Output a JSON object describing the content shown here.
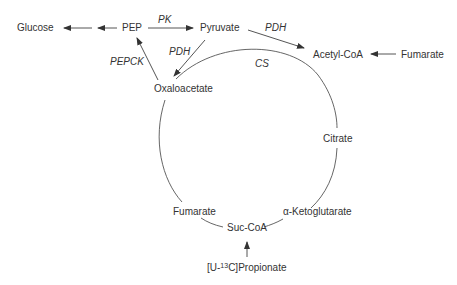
{
  "diagram": {
    "type": "metabolic-pathway",
    "nodes": {
      "glucose": "Glucose",
      "pep": "PEP",
      "pyruvate": "Pyruvate",
      "acetyl_coa": "Acetyl-CoA",
      "fumarate_in": "Fumarate",
      "oxaloacetate": "Oxaloacetate",
      "citrate": "Citrate",
      "alpha_kg": "α-Ketoglutarate",
      "suc_coa": "Suc-CoA",
      "fumarate": "Fumarate",
      "propionate_prefix": "[U-",
      "propionate_sup": "13",
      "propionate_suffix": "C]Propionate"
    },
    "enzymes": {
      "pk": "PK",
      "pdh_top": "PDH",
      "pdh_left": "PDH",
      "pepck": "PEPCK",
      "cs": "CS"
    },
    "edges": [
      {
        "from": "PEP",
        "to": "Glucose"
      },
      {
        "from": "PEP",
        "to": "Pyruvate",
        "enzyme": "PK"
      },
      {
        "from": "Pyruvate",
        "to": "Acetyl-CoA",
        "enzyme": "PDH"
      },
      {
        "from": "Pyruvate",
        "to": "Oxaloacetate",
        "enzyme": "PDH"
      },
      {
        "from": "Oxaloacetate",
        "to": "PEP",
        "enzyme": "PEPCK"
      },
      {
        "from": "Fumarate",
        "to": "Acetyl-CoA"
      },
      {
        "from": "[U-13C]Propionate",
        "to": "Suc-CoA"
      },
      {
        "from": "Oxaloacetate",
        "to": "Citrate",
        "enzyme": "CS",
        "style": "cycle-arc"
      }
    ],
    "colors": {
      "line": "#555555",
      "text": "#333333"
    }
  }
}
